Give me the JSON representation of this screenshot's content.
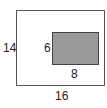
{
  "diagram": {
    "outer_rect": {
      "width_label": "16",
      "height_label": "14"
    },
    "inner_rect": {
      "width_label": "8",
      "height_label": "6",
      "fill": "#9a9a9a"
    }
  }
}
